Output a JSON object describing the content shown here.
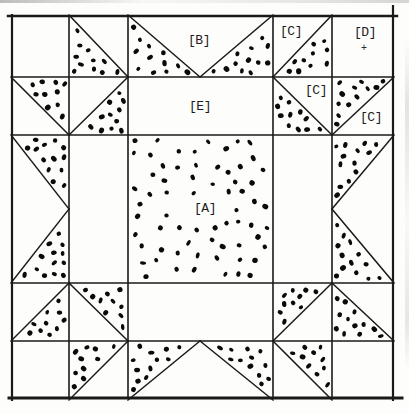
{
  "figure": {
    "type": "quilt-block-diagram",
    "canvas": {
      "width": 409,
      "height": 414
    },
    "colors": {
      "background": "#fdfdfb",
      "line": "#1a1a1a",
      "dot": "#0a0a0a",
      "label": "#1c1c1c"
    },
    "style": {
      "outer_border_width": 2.5,
      "grid_line_width": 1.6,
      "diagonal_line_width": 1.5
    },
    "labels": {
      "a": "[A]",
      "b": "[B]",
      "c_top": "[C]",
      "c_mid": "[C]",
      "c_right": "[C]",
      "d": "[D]",
      "d_mark": "+",
      "e": "[E]"
    },
    "border_lines": [
      {
        "x1": 8,
        "y1": 16,
        "x2": 397,
        "y2": 16,
        "w": 2.5
      },
      {
        "x1": 12,
        "y1": 15,
        "x2": 12,
        "y2": 400,
        "w": 2.2
      },
      {
        "x1": 393,
        "y1": 6,
        "x2": 393,
        "y2": 400,
        "w": 2.2
      },
      {
        "x1": 9,
        "y1": 398,
        "x2": 402,
        "y2": 398,
        "w": 3.0
      }
    ],
    "grid_verticals": [
      69,
      128,
      273,
      332
    ],
    "grid_vertical_extent": {
      "y1": 16,
      "y2": 398
    },
    "grid_horizontals": [
      77,
      135,
      283,
      341
    ],
    "grid_horizontal_extent": {
      "x1": 12,
      "x2": 393
    },
    "diagonal_lines": [
      [
        69,
        15,
        128,
        77
      ],
      [
        128,
        15,
        200,
        77
      ],
      [
        273,
        15,
        200,
        77
      ],
      [
        273,
        77,
        332,
        15
      ],
      [
        11,
        77,
        69,
        135
      ],
      [
        69,
        135,
        128,
        77
      ],
      [
        273,
        77,
        332,
        135
      ],
      [
        332,
        135,
        394,
        77
      ],
      [
        11,
        135,
        69,
        209
      ],
      [
        11,
        283,
        69,
        209
      ],
      [
        394,
        135,
        332,
        209
      ],
      [
        394,
        283,
        332,
        209
      ],
      [
        11,
        341,
        69,
        283
      ],
      [
        69,
        283,
        128,
        341
      ],
      [
        273,
        341,
        332,
        283
      ],
      [
        332,
        283,
        394,
        341
      ],
      [
        69,
        400,
        128,
        341
      ],
      [
        128,
        400,
        200,
        341
      ],
      [
        273,
        400,
        200,
        341
      ],
      [
        273,
        341,
        332,
        400
      ]
    ],
    "speckled_regions": [
      {
        "name": "hst-r1c2",
        "polygon": [
          [
            69,
            15
          ],
          [
            69,
            77
          ],
          [
            128,
            77
          ]
        ],
        "dots": 11
      },
      {
        "name": "geese-top-left",
        "polygon": [
          [
            128,
            15
          ],
          [
            128,
            77
          ],
          [
            200,
            77
          ]
        ],
        "dots": 12
      },
      {
        "name": "geese-top-right",
        "polygon": [
          [
            273,
            15
          ],
          [
            273,
            77
          ],
          [
            200,
            77
          ]
        ],
        "dots": 12
      },
      {
        "name": "hst-r1c4",
        "polygon": [
          [
            273,
            77
          ],
          [
            332,
            15
          ],
          [
            332,
            77
          ]
        ],
        "dots": 10
      },
      {
        "name": "hst-r2c1",
        "polygon": [
          [
            11,
            77
          ],
          [
            69,
            77
          ],
          [
            69,
            135
          ]
        ],
        "dots": 10
      },
      {
        "name": "hst-r2c2",
        "polygon": [
          [
            69,
            135
          ],
          [
            128,
            77
          ],
          [
            128,
            135
          ]
        ],
        "dots": 11
      },
      {
        "name": "hst-r2c4",
        "polygon": [
          [
            273,
            77
          ],
          [
            273,
            135
          ],
          [
            332,
            135
          ]
        ],
        "dots": 11
      },
      {
        "name": "hst-r2c5",
        "polygon": [
          [
            332,
            77
          ],
          [
            394,
            77
          ],
          [
            332,
            135
          ]
        ],
        "dots": 12
      },
      {
        "name": "geese-left-top",
        "polygon": [
          [
            11,
            135
          ],
          [
            69,
            135
          ],
          [
            69,
            209
          ]
        ],
        "dots": 13
      },
      {
        "name": "geese-left-bottom",
        "polygon": [
          [
            69,
            209
          ],
          [
            69,
            283
          ],
          [
            11,
            283
          ]
        ],
        "dots": 13
      },
      {
        "name": "geese-right-top",
        "polygon": [
          [
            332,
            135
          ],
          [
            394,
            135
          ],
          [
            332,
            209
          ]
        ],
        "dots": 13
      },
      {
        "name": "geese-right-bottom",
        "polygon": [
          [
            332,
            209
          ],
          [
            332,
            283
          ],
          [
            394,
            283
          ]
        ],
        "dots": 13
      },
      {
        "name": "center-square-a",
        "polygon": [
          [
            128,
            135
          ],
          [
            273,
            135
          ],
          [
            273,
            283
          ],
          [
            128,
            283
          ]
        ],
        "dots": 66
      },
      {
        "name": "hst-r4c1",
        "polygon": [
          [
            11,
            341
          ],
          [
            69,
            283
          ],
          [
            69,
            341
          ]
        ],
        "dots": 10
      },
      {
        "name": "hst-r4c2",
        "polygon": [
          [
            69,
            283
          ],
          [
            128,
            283
          ],
          [
            128,
            341
          ]
        ],
        "dots": 10
      },
      {
        "name": "hst-r4c4",
        "polygon": [
          [
            273,
            283
          ],
          [
            332,
            283
          ],
          [
            273,
            341
          ]
        ],
        "dots": 10
      },
      {
        "name": "hst-r4c5",
        "polygon": [
          [
            332,
            283
          ],
          [
            332,
            341
          ],
          [
            394,
            341
          ]
        ],
        "dots": 12
      },
      {
        "name": "hst-r5c2",
        "polygon": [
          [
            69,
            341
          ],
          [
            128,
            341
          ],
          [
            69,
            400
          ]
        ],
        "dots": 10
      },
      {
        "name": "geese-bottom-left",
        "polygon": [
          [
            128,
            341
          ],
          [
            200,
            341
          ],
          [
            128,
            400
          ]
        ],
        "dots": 12
      },
      {
        "name": "geese-bottom-right",
        "polygon": [
          [
            200,
            341
          ],
          [
            273,
            341
          ],
          [
            273,
            400
          ]
        ],
        "dots": 12
      },
      {
        "name": "hst-r5c4",
        "polygon": [
          [
            273,
            341
          ],
          [
            332,
            341
          ],
          [
            332,
            400
          ]
        ],
        "dots": 10
      }
    ],
    "label_keepouts": [
      {
        "x": 180,
        "y": 195,
        "w": 50,
        "h": 26
      }
    ]
  }
}
